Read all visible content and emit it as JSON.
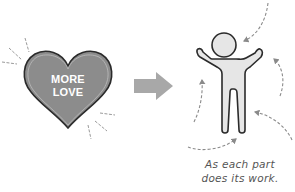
{
  "illustration": {
    "heart": {
      "label_line1": "MORE",
      "label_line2": "LOVE",
      "fill_color": "#8c8c8c",
      "outline_color": "#2b2b2b"
    },
    "arrow": {
      "direction": "right",
      "color": "#a8a8a8"
    },
    "figure": {
      "description": "human figure with raised arms",
      "fill_color": "#e6e6e6",
      "outline_color": "#2b2b2b",
      "dashed_arrow_count": 5,
      "dashed_arrow_color": "#8a8a8a"
    },
    "caption": {
      "line1": "As each part",
      "line2": "does its work."
    }
  }
}
